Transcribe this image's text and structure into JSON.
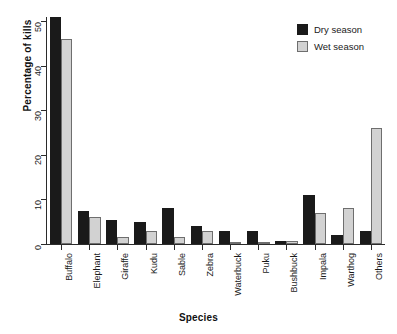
{
  "chart_data": {
    "type": "bar",
    "title": "",
    "xlabel": "Species",
    "ylabel": "Percentage of kills",
    "categories": [
      "Buffalo",
      "Elephant",
      "Giraffe",
      "Kudu",
      "Sable",
      "Zebra",
      "Waterbuck",
      "Puku",
      "Bushbuck",
      "Impala",
      "Warthog",
      "Others"
    ],
    "series": [
      {
        "name": "Dry season",
        "color": "#1a1a1a",
        "values": [
          51,
          7.5,
          5.5,
          5,
          8,
          4,
          3,
          3,
          0.6,
          11,
          2,
          3
        ]
      },
      {
        "name": "Wet season",
        "color": "#d2d2d2",
        "values": [
          46,
          6,
          1.5,
          3,
          1.5,
          3,
          0.3,
          0.2,
          0.6,
          7,
          8,
          26
        ]
      }
    ],
    "ylim": [
      0,
      51
    ],
    "yticks": [
      0,
      10,
      20,
      30,
      40,
      50
    ],
    "ytick_labels": [
      "0",
      "10",
      "20",
      "30",
      "40",
      "50"
    ],
    "grid": false,
    "legend_position": "top-right"
  },
  "legend": {
    "entries": [
      {
        "label": "Dry season",
        "key": "dry"
      },
      {
        "label": "Wet season",
        "key": "wet"
      }
    ]
  }
}
